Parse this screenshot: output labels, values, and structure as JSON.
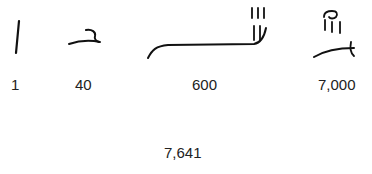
{
  "glyphs": [
    {
      "label": "1",
      "glyph_name": "hieratic-one-glyph"
    },
    {
      "label": "40",
      "glyph_name": "hieratic-forty-glyph"
    },
    {
      "label": "600",
      "glyph_name": "hieratic-six-hundred-glyph"
    },
    {
      "label": "7,000",
      "glyph_name": "hieratic-seven-thousand-glyph"
    }
  ],
  "total": "7,641",
  "colors": {
    "ink": "#111111",
    "text": "#222222",
    "background": "#ffffff"
  }
}
